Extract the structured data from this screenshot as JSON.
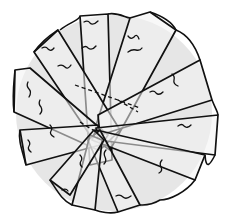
{
  "image": {
    "subject": "sketch of round shape composed of overlapping radial slices",
    "width": 229,
    "height": 224,
    "colors": {
      "background": "#ffffff",
      "stroke": "#111111",
      "shade": "#d9d9d9",
      "fill": "#eeeeee"
    },
    "outline": {
      "cx": 114,
      "cy": 112,
      "r": 100
    },
    "hub": {
      "x": 96,
      "y": 132
    },
    "slices": [
      {
        "points": "80,16 108,14 112,160 90,165"
      },
      {
        "points": "130,18 150,12 176,30 110,150 92,138"
      },
      {
        "points": "34,52 58,30 120,130 100,150"
      },
      {
        "points": "15,70 30,68 108,135 98,150 14,112"
      },
      {
        "points": "20,130 98,125 100,145 26,165"
      },
      {
        "points": "200,60 212,100 100,135 98,115"
      },
      {
        "points": "96,128 218,115 215,155 98,140"
      },
      {
        "points": "96,130 205,155 195,180 92,140"
      },
      {
        "points": "100,130 140,205 118,212 88,140"
      },
      {
        "points": "90,135 102,140 95,210 72,205"
      },
      {
        "points": "94,130 104,140 70,195 50,180"
      }
    ]
  }
}
